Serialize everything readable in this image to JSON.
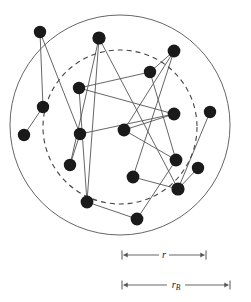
{
  "figure": {
    "title": "",
    "background_color": "#ffffff",
    "stroke_color": "#555555",
    "node_color": "#1a1a1a"
  },
  "circles": {
    "outer": {
      "name": "outer-solid-circle",
      "cx": 120,
      "cy": 125,
      "r": 110,
      "style": "solid",
      "stroke": "#666666",
      "stroke_width": 1
    },
    "inner": {
      "name": "inner-dashed-circle",
      "cx": 120,
      "cy": 127,
      "r": 77,
      "style": "dashed",
      "stroke": "#444444",
      "stroke_width": 1.1,
      "dash": "5,4"
    }
  },
  "nodes": [
    {
      "id": 0,
      "cx": 40,
      "cy": 32,
      "r": 6.2
    },
    {
      "id": 1,
      "cx": 99,
      "cy": 38,
      "r": 6.6
    },
    {
      "id": 2,
      "cx": 174,
      "cy": 51,
      "r": 6.4
    },
    {
      "id": 3,
      "cx": 150,
      "cy": 72,
      "r": 6.2
    },
    {
      "id": 4,
      "cx": 79,
      "cy": 88,
      "r": 6.2
    },
    {
      "id": 5,
      "cx": 43,
      "cy": 107,
      "r": 6.2
    },
    {
      "id": 6,
      "cx": 24,
      "cy": 135,
      "r": 6.2
    },
    {
      "id": 7,
      "cx": 174,
      "cy": 114,
      "r": 6.4
    },
    {
      "id": 8,
      "cx": 210,
      "cy": 112,
      "r": 6.2
    },
    {
      "id": 9,
      "cx": 124,
      "cy": 130,
      "r": 6.4
    },
    {
      "id": 10,
      "cx": 80,
      "cy": 134,
      "r": 6.2
    },
    {
      "id": 11,
      "cx": 70,
      "cy": 165,
      "r": 6.2
    },
    {
      "id": 12,
      "cx": 176,
      "cy": 160,
      "r": 6.4
    },
    {
      "id": 13,
      "cx": 198,
      "cy": 168,
      "r": 6.2
    },
    {
      "id": 14,
      "cx": 133,
      "cy": 177,
      "r": 6.4
    },
    {
      "id": 15,
      "cx": 178,
      "cy": 189,
      "r": 6.6
    },
    {
      "id": 16,
      "cx": 87,
      "cy": 202,
      "r": 6.4
    },
    {
      "id": 17,
      "cx": 137,
      "cy": 219,
      "r": 6.4
    }
  ],
  "edges": [
    {
      "from": 0,
      "to": 10
    },
    {
      "from": 0,
      "to": 5
    },
    {
      "from": 1,
      "to": 11
    },
    {
      "from": 1,
      "to": 16
    },
    {
      "from": 1,
      "to": 15
    },
    {
      "from": 2,
      "to": 3
    },
    {
      "from": 2,
      "to": 9
    },
    {
      "from": 3,
      "to": 4
    },
    {
      "from": 3,
      "to": 12
    },
    {
      "from": 4,
      "to": 7
    },
    {
      "from": 5,
      "to": 6
    },
    {
      "from": 7,
      "to": 9
    },
    {
      "from": 7,
      "to": 10
    },
    {
      "from": 8,
      "to": 15
    },
    {
      "from": 9,
      "to": 12
    },
    {
      "from": 10,
      "to": 11
    },
    {
      "from": 12,
      "to": 17
    },
    {
      "from": 13,
      "to": 15
    },
    {
      "from": 14,
      "to": 15
    },
    {
      "from": 16,
      "to": 17
    },
    {
      "from": 2,
      "to": 14
    },
    {
      "from": 4,
      "to": 16
    }
  ],
  "measurements": [
    {
      "name": "dimension-r",
      "label": "r",
      "subscript": "",
      "x_start": 122,
      "x_end": 206,
      "y": 255
    },
    {
      "name": "dimension-rB",
      "label": "r",
      "subscript": "B",
      "x_start": 122,
      "x_end": 230,
      "y": 285
    }
  ]
}
